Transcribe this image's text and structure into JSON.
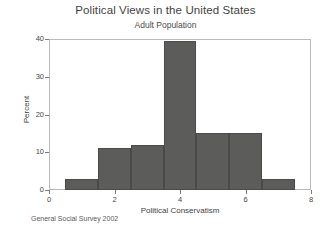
{
  "chart_data": {
    "type": "bar",
    "title": "Political Views in the United States",
    "subtitle": "Adult Population",
    "caption": "General Social Survey 2002",
    "xlabel": "Political Conservatism",
    "ylabel": "Percent",
    "categories": [
      "1",
      "2",
      "3",
      "4",
      "5",
      "6",
      "7"
    ],
    "bin_edges": [
      0.5,
      1.5,
      2.5,
      3.5,
      4.5,
      5.5,
      6.5,
      7.5
    ],
    "values": [
      3,
      11,
      12,
      39.5,
      15,
      15,
      3
    ],
    "xlim": [
      0,
      8
    ],
    "ylim": [
      0,
      40
    ],
    "xticks": [
      "0",
      "2",
      "4",
      "6",
      "8"
    ],
    "xtick_values": [
      0,
      2,
      4,
      6,
      8
    ],
    "yticks": [
      "0",
      "10",
      "20",
      "30",
      "40"
    ],
    "ytick_values": [
      0,
      10,
      20,
      30,
      40
    ],
    "grid": false,
    "legend": false,
    "bar_color": "#5c5c5a",
    "frame_color": "#b9b9b9"
  }
}
